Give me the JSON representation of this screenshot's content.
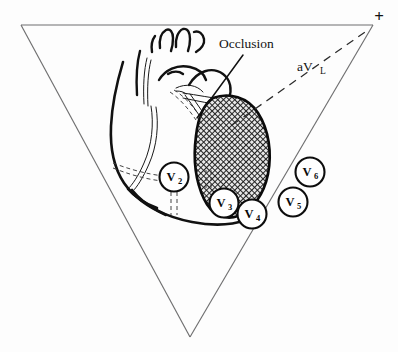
{
  "figure": {
    "background_color": "#fdfdfd",
    "stroke_color": "#111111",
    "triangle_color": "#6f6f70",
    "infarct_fill_color": "#595959"
  },
  "annotations": {
    "occlusion_label": "Occlusion",
    "avl_base": "aV",
    "avl_subscript": "L",
    "polarity_marker": "+"
  },
  "leads": [
    {
      "name": "lead-v2",
      "base": "V",
      "subscript": "2",
      "cx": 174,
      "cy": 177,
      "r": 14.5
    },
    {
      "name": "lead-v3",
      "base": "V",
      "subscript": "3",
      "cx": 224,
      "cy": 203,
      "r": 14.5
    },
    {
      "name": "lead-v4",
      "base": "V",
      "subscript": "4",
      "cx": 252,
      "cy": 214,
      "r": 14.5
    },
    {
      "name": "lead-v5",
      "base": "V",
      "subscript": "5",
      "cx": 293,
      "cy": 202,
      "r": 14.5
    },
    {
      "name": "lead-v6",
      "base": "V",
      "subscript": "6",
      "cx": 310,
      "cy": 172,
      "r": 14.5
    }
  ],
  "geometry": {
    "triangle_apex_left": "21,25",
    "triangle_apex_right": "373,25",
    "triangle_apex_bottom": "190,337"
  }
}
